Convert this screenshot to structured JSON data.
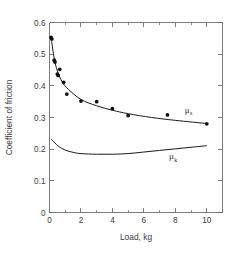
{
  "chart_data": {
    "type": "scatter",
    "title": "",
    "xlabel": "Load, kg",
    "ylabel": "Coefficient of friction",
    "xlim": [
      0,
      11
    ],
    "ylim": [
      0,
      0.6
    ],
    "grid": false,
    "legend_position": "inline-right",
    "x_ticks": [
      0,
      2,
      4,
      6,
      8,
      10
    ],
    "x_tick_labels": [
      "0",
      "2",
      "4",
      "6",
      "8",
      "10"
    ],
    "x_minor_ticks": [
      1,
      3,
      5,
      7,
      9,
      11
    ],
    "y_ticks": [
      0,
      0.1,
      0.2,
      0.3,
      0.4,
      0.5,
      0.6
    ],
    "y_tick_labels": [
      "0",
      "0.1",
      "0.2",
      "0.3",
      "0.4",
      "0.5",
      "0.6"
    ],
    "series": [
      {
        "name": "mu_s",
        "label": "μ",
        "label_subscript": "s",
        "style": "points-with-fit-curve",
        "points": [
          {
            "x": 0.1,
            "y": 0.553
          },
          {
            "x": 0.15,
            "y": 0.548
          },
          {
            "x": 0.3,
            "y": 0.481
          },
          {
            "x": 0.35,
            "y": 0.475
          },
          {
            "x": 0.5,
            "y": 0.437
          },
          {
            "x": 0.55,
            "y": 0.433
          },
          {
            "x": 0.65,
            "y": 0.452
          },
          {
            "x": 0.9,
            "y": 0.411
          },
          {
            "x": 1.1,
            "y": 0.374
          },
          {
            "x": 2.0,
            "y": 0.352
          },
          {
            "x": 3.0,
            "y": 0.35
          },
          {
            "x": 4.0,
            "y": 0.328
          },
          {
            "x": 5.0,
            "y": 0.306
          },
          {
            "x": 7.5,
            "y": 0.308
          },
          {
            "x": 10.0,
            "y": 0.28
          }
        ],
        "fit_curve": [
          {
            "x": 0.1,
            "y": 0.553
          },
          {
            "x": 0.3,
            "y": 0.487
          },
          {
            "x": 0.5,
            "y": 0.447
          },
          {
            "x": 0.8,
            "y": 0.413
          },
          {
            "x": 1.2,
            "y": 0.389
          },
          {
            "x": 2.0,
            "y": 0.357
          },
          {
            "x": 3.0,
            "y": 0.337
          },
          {
            "x": 4.0,
            "y": 0.323
          },
          {
            "x": 5.0,
            "y": 0.312
          },
          {
            "x": 6.5,
            "y": 0.3
          },
          {
            "x": 8.0,
            "y": 0.291
          },
          {
            "x": 10.0,
            "y": 0.281
          }
        ]
      },
      {
        "name": "mu_k",
        "label": "μ",
        "label_subscript": "k",
        "style": "line",
        "points": [],
        "fit_curve": [
          {
            "x": 0.1,
            "y": 0.232
          },
          {
            "x": 0.3,
            "y": 0.222
          },
          {
            "x": 0.6,
            "y": 0.208
          },
          {
            "x": 1.0,
            "y": 0.197
          },
          {
            "x": 1.5,
            "y": 0.19
          },
          {
            "x": 2.0,
            "y": 0.186
          },
          {
            "x": 3.0,
            "y": 0.184
          },
          {
            "x": 4.0,
            "y": 0.184
          },
          {
            "x": 5.0,
            "y": 0.186
          },
          {
            "x": 6.0,
            "y": 0.191
          },
          {
            "x": 7.0,
            "y": 0.196
          },
          {
            "x": 8.0,
            "y": 0.201
          },
          {
            "x": 9.0,
            "y": 0.206
          },
          {
            "x": 10.0,
            "y": 0.211
          }
        ]
      }
    ],
    "annotations": [
      {
        "name": "mu-s-label",
        "text": "μ",
        "sub": "s",
        "x": 8.6,
        "y": 0.315
      },
      {
        "name": "mu-k-label",
        "text": "μ",
        "sub": "k",
        "x": 7.6,
        "y": 0.168
      }
    ]
  }
}
